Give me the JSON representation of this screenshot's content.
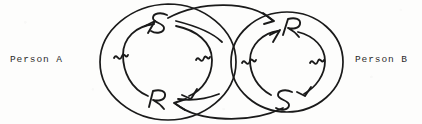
{
  "figure": {
    "type": "hand-drawn-diagram",
    "background_color": "#fdfdfc",
    "ink_color": "#1a1a1a",
    "width": 422,
    "height": 124
  },
  "labels": {
    "person_a": "Person A",
    "person_b": "Person B"
  },
  "loops": [
    {
      "id": "loop-a",
      "owner": "Person A",
      "center_x": 168,
      "center_y": 62,
      "outer_rx": 68,
      "outer_ry": 58,
      "inner_rx": 45,
      "inner_ry": 38,
      "direction": "clockwise",
      "nodes": [
        {
          "id": "a-sender",
          "letter": "S",
          "role": "sender",
          "position": "top",
          "x": 160,
          "y": 22
        },
        {
          "id": "a-receiver",
          "letter": "R",
          "role": "receiver",
          "position": "bottom",
          "x": 157,
          "y": 100
        }
      ],
      "tick_marks": 4
    },
    {
      "id": "loop-b",
      "owner": "Person B",
      "center_x": 287,
      "center_y": 62,
      "outer_rx": 56,
      "outer_ry": 50,
      "inner_rx": 37,
      "inner_ry": 33,
      "direction": "clockwise",
      "nodes": [
        {
          "id": "b-receiver",
          "letter": "R",
          "role": "receiver",
          "position": "top",
          "x": 290,
          "y": 27
        },
        {
          "id": "b-sender",
          "letter": "S",
          "role": "sender",
          "position": "bottom",
          "x": 285,
          "y": 99
        }
      ],
      "tick_marks": 4
    }
  ],
  "connectors": [
    {
      "id": "connector-top",
      "from": "a-sender",
      "to": "b-receiver",
      "path_side": "top",
      "arrowheads": 2,
      "description": "message arc from Person A sender to Person B receiver"
    },
    {
      "id": "connector-bottom",
      "from": "b-sender",
      "to": "a-receiver",
      "path_side": "bottom",
      "arrowheads": 2,
      "description": "message arc from Person B sender to Person A receiver"
    }
  ]
}
